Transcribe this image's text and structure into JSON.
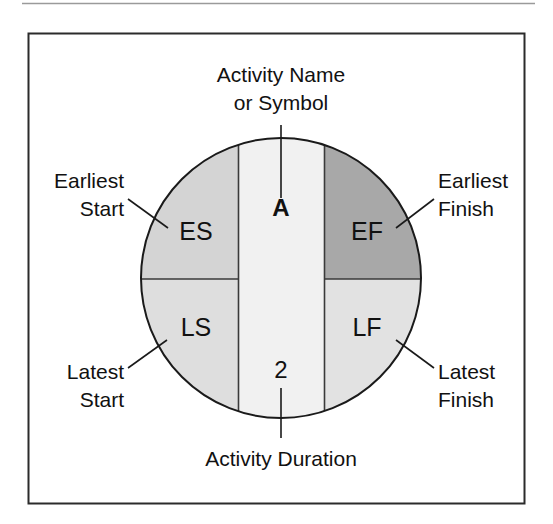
{
  "figure": {
    "top_rule_color": "#9a9a9a",
    "frame_color": "#2b2b2b",
    "outline_color": "#1a1a1a",
    "text_color": "#111111",
    "background": "#ffffff"
  },
  "node": {
    "center_band": {
      "name_label": "A",
      "duration_label": "2",
      "fill": "#f1f1f1"
    },
    "quadrants": [
      {
        "key": "ES",
        "label": "ES",
        "fill": "#d4d4d4",
        "position": "top-left"
      },
      {
        "key": "EF",
        "label": "EF",
        "fill": "#a8a8a8",
        "position": "top-right"
      },
      {
        "key": "LS",
        "label": "LS",
        "fill": "#dedede",
        "position": "bottom-left"
      },
      {
        "key": "LF",
        "label": "LF",
        "fill": "#e2e2e2",
        "position": "bottom-right"
      }
    ]
  },
  "callouts": {
    "top": {
      "line1": "Activity Name",
      "line2": "or Symbol"
    },
    "bottom": {
      "line1": "Activity Duration"
    },
    "top_left": {
      "line1": "Earliest",
      "line2": "Start"
    },
    "top_right": {
      "line1": "Earliest",
      "line2": "Finish"
    },
    "bottom_left": {
      "line1": "Latest",
      "line2": "Start"
    },
    "bottom_right": {
      "line1": "Latest",
      "line2": "Finish"
    }
  }
}
